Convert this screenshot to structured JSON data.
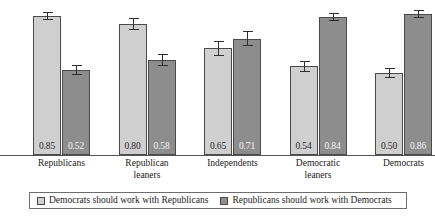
{
  "chart_data": {
    "type": "bar",
    "title": "",
    "subtitle": "",
    "xlabel": "",
    "ylabel": "",
    "ylim": [
      0,
      0.95
    ],
    "grid": false,
    "legend_position": "bottom",
    "categories": [
      "Republicans",
      "Republican leaners",
      "Independents",
      "Democratic leaners",
      "Democrats"
    ],
    "category_lines": [
      [
        "Republicans"
      ],
      [
        "Republican",
        "leaners"
      ],
      [
        "Independents"
      ],
      [
        "Democratic",
        "leaners"
      ],
      [
        "Democrats"
      ]
    ],
    "series": [
      {
        "name": "Democrats should work with Republicans",
        "color": "#cfcfcf",
        "values": [
          0.85,
          0.8,
          0.65,
          0.54,
          0.5
        ],
        "labels": [
          "0.85",
          "0.80",
          "0.65",
          "0.54",
          "0.50"
        ],
        "errors": [
          0.025,
          0.035,
          0.045,
          0.035,
          0.03
        ]
      },
      {
        "name": "Republicans should work with Democrats",
        "color": "#8d8d8d",
        "values": [
          0.52,
          0.58,
          0.71,
          0.84,
          0.86
        ],
        "labels": [
          "0.52",
          "0.58",
          "0.71",
          "0.84",
          "0.86"
        ],
        "errors": [
          0.03,
          0.035,
          0.045,
          0.025,
          0.025
        ]
      }
    ]
  },
  "legend": {
    "entries": [
      {
        "label": "Democrats should work with Republicans"
      },
      {
        "label": "Republicans should work with Democrats"
      }
    ]
  }
}
